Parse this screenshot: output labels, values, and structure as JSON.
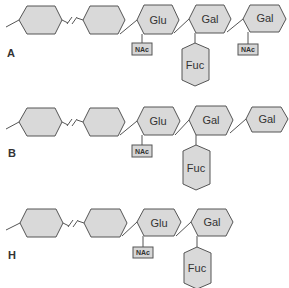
{
  "diagram": {
    "rows": [
      {
        "label": "A",
        "chain": [
          "",
          "",
          "Glu",
          "Gal",
          "Gal"
        ],
        "substituents": {
          "glu": "NAc",
          "gal1": "Fuc",
          "gal2": "NAc"
        }
      },
      {
        "label": "B",
        "chain": [
          "",
          "",
          "Glu",
          "Gal",
          "Gal"
        ],
        "substituents": {
          "glu": "NAc",
          "gal1": "Fuc"
        }
      },
      {
        "label": "H",
        "chain": [
          "",
          "",
          "Glu",
          "Gal"
        ],
        "substituents": {
          "glu": "NAc",
          "gal1": "Fuc"
        }
      }
    ],
    "colors": {
      "fill": "#d9d9d9",
      "stroke": "#555555",
      "text": "#333333"
    }
  }
}
